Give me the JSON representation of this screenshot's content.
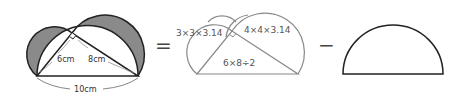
{
  "figure1": {
    "leg_left_label": "6cm",
    "leg_right_label": "8cm",
    "hypotenuse_label": "10cm",
    "shade_color": "#8a8a8a",
    "stroke_color": "#222222"
  },
  "operators": {
    "equals": "=",
    "minus": "−"
  },
  "figure2": {
    "small_semicircle_formula": "3×3×3.14",
    "large_semicircle_formula": "4×4×3.14",
    "triangle_formula": "6×8÷2",
    "stroke_color": "#888888"
  },
  "figure3": {
    "shape": "semicircle",
    "stroke_color": "#222222"
  }
}
